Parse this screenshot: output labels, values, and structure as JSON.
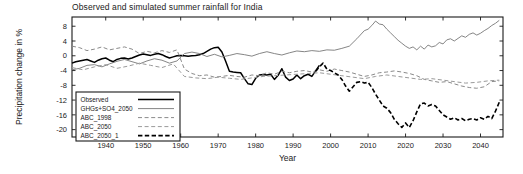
{
  "chart_data": {
    "type": "line",
    "title": "Observed and simulated summer rainfall for India",
    "xlabel": "Year",
    "ylabel": "Precipitation change in %",
    "xlim": [
      1931,
      2046
    ],
    "ylim": [
      -22,
      10.5
    ],
    "xticks": [
      1940,
      1950,
      1960,
      1970,
      1980,
      1990,
      2000,
      2010,
      2020,
      2030,
      2040
    ],
    "yticks": [
      8,
      4,
      0,
      -4,
      -8,
      -12,
      -16,
      -20
    ],
    "grid": false,
    "legend_position": "lower-left-inside",
    "series": [
      {
        "name": "Observed",
        "color": "#000000",
        "style": "solid",
        "width": 1.5,
        "x": [
          1931,
          1932,
          1933,
          1934,
          1935,
          1936,
          1937,
          1938,
          1939,
          1940,
          1941,
          1942,
          1943,
          1944,
          1945,
          1946,
          1947,
          1948,
          1949,
          1950,
          1951,
          1952,
          1953,
          1954,
          1955,
          1956,
          1957,
          1958,
          1959,
          1960,
          1961,
          1962,
          1963,
          1964,
          1965,
          1966,
          1967,
          1968,
          1969,
          1970,
          1971,
          1972,
          1973,
          1974,
          1975,
          1976,
          1977,
          1978,
          1979,
          1980,
          1981,
          1982,
          1983,
          1984,
          1985,
          1986,
          1987,
          1988,
          1989,
          1990,
          1991,
          1992,
          1993,
          1994,
          1995,
          1996,
          1997
        ],
        "y": [
          -2.0,
          -1.6,
          -1.4,
          -1.2,
          -1.0,
          -1.4,
          -1.8,
          -1.2,
          -0.8,
          -0.6,
          -1.2,
          -1.6,
          -1.0,
          -0.7,
          -0.6,
          -0.9,
          -0.6,
          -0.2,
          0.2,
          0.5,
          0.3,
          0.1,
          0.4,
          0.6,
          0.3,
          -0.2,
          -0.6,
          -0.3,
          0.0,
          0.1,
          0.0,
          -0.1,
          0.0,
          0.1,
          0.3,
          0.6,
          1.2,
          1.8,
          2.2,
          2.3,
          1.0,
          -1.5,
          -4.2,
          -4.4,
          -4.5,
          -4.6,
          -6.2,
          -7.6,
          -7.8,
          -6.1,
          -5.2,
          -5.1,
          -5.2,
          -5.0,
          -6.4,
          -5.3,
          -3.5,
          -5.8,
          -6.7,
          -6.3,
          -5.2,
          -6.2,
          -5.4,
          -5.0,
          -5.6,
          -4.1,
          -2.6
        ]
      },
      {
        "name": "GHGs+SO4_2050",
        "color": "#777777",
        "style": "solid",
        "width": 0.9,
        "x": [
          1931,
          1933,
          1935,
          1937,
          1939,
          1941,
          1943,
          1945,
          1947,
          1949,
          1951,
          1953,
          1955,
          1957,
          1959,
          1961,
          1963,
          1965,
          1967,
          1969,
          1971,
          1973,
          1975,
          1977,
          1979,
          1981,
          1983,
          1985,
          1987,
          1989,
          1991,
          1993,
          1995,
          1997,
          1999,
          2001,
          2003,
          2005,
          2007,
          2009,
          2010,
          2011,
          2012,
          2013,
          2014,
          2015,
          2016,
          2017,
          2018,
          2019,
          2020,
          2021,
          2022,
          2023,
          2024,
          2025,
          2026,
          2027,
          2028,
          2029,
          2030,
          2031,
          2032,
          2033,
          2034,
          2035,
          2036,
          2037,
          2038,
          2039,
          2040,
          2041,
          2042,
          2043,
          2044,
          2045
        ],
        "y": [
          -3.8,
          -3.4,
          -2.6,
          -2.4,
          -3.0,
          -2.2,
          -1.5,
          -1.0,
          -1.6,
          -2.2,
          -1.4,
          -0.8,
          -1.2,
          -2.0,
          -1.4,
          0.6,
          1.0,
          0.6,
          -0.2,
          0.4,
          -0.3,
          0.1,
          0.6,
          0.3,
          -0.1,
          0.6,
          1.1,
          0.6,
          0.2,
          0.8,
          1.3,
          1.1,
          1.4,
          1.2,
          1.6,
          1.5,
          2.0,
          2.6,
          4.6,
          6.8,
          7.2,
          8.2,
          9.4,
          8.6,
          8.4,
          7.2,
          6.2,
          5.2,
          4.2,
          3.4,
          2.6,
          2.0,
          2.4,
          1.6,
          2.6,
          1.8,
          2.9,
          2.4,
          2.7,
          3.6,
          3.2,
          4.3,
          4.6,
          4.0,
          4.7,
          5.4,
          5.0,
          5.8,
          6.2,
          5.6,
          6.1,
          6.8,
          7.4,
          8.2,
          8.8,
          9.6
        ]
      },
      {
        "name": "ABC_1998",
        "color": "#8a8a8a",
        "style": "dashed",
        "width": 1.0,
        "x": [
          1931,
          1933,
          1935,
          1937,
          1939,
          1941,
          1943,
          1945,
          1947,
          1949,
          1951,
          1953,
          1955,
          1957,
          1959,
          1961,
          1963,
          1965,
          1967,
          1969,
          1971,
          1973,
          1975,
          1977,
          1979,
          1981,
          1983,
          1985,
          1987,
          1989,
          1991,
          1993,
          1995,
          1997,
          1999,
          2001,
          2003,
          2005,
          2007,
          2009,
          2011,
          2013,
          2015,
          2017,
          2019,
          2021,
          2023,
          2025,
          2027,
          2029,
          2031,
          2033,
          2035,
          2037,
          2039,
          2041,
          2043,
          2045
        ],
        "y": [
          2.6,
          2.2,
          1.4,
          1.8,
          2.4,
          1.6,
          2.0,
          2.4,
          1.8,
          0.6,
          1.2,
          0.8,
          1.4,
          0.9,
          1.6,
          -3.6,
          -4.8,
          -5.4,
          -5.2,
          -5.8,
          -5.6,
          -5.3,
          -5.6,
          -5.8,
          -5.2,
          -5.4,
          -4.6,
          -5.0,
          -4.2,
          -4.6,
          -4.2,
          -4.0,
          -4.4,
          -3.8,
          -4.2,
          -3.6,
          -4.0,
          -4.4,
          -5.0,
          -5.6,
          -5.2,
          -4.6,
          -4.4,
          -4.1,
          -4.4,
          -4.8,
          -5.4,
          -6.4,
          -6.8,
          -7.2,
          -7.0,
          -7.6,
          -8.2,
          -8.6,
          -8.8,
          -8.4,
          -7.0,
          -6.8
        ]
      },
      {
        "name": "ABC_2050",
        "color": "#9a9a9a",
        "style": "dashed",
        "width": 1.0,
        "x": [
          1931,
          1934,
          1937,
          1940,
          1943,
          1946,
          1949,
          1952,
          1955,
          1958,
          1961,
          1964,
          1967,
          1970,
          1973,
          1976,
          1979,
          1982,
          1985,
          1988,
          1991,
          1994,
          1997,
          2000,
          2003,
          2006,
          2009,
          2012,
          2015,
          2018,
          2021,
          2024,
          2027,
          2030,
          2033,
          2036,
          2039,
          2042,
          2045
        ],
        "y": [
          -3.2,
          -3.8,
          -3.0,
          -2.4,
          -3.4,
          -2.8,
          -2.0,
          -2.6,
          -3.2,
          -2.2,
          -5.6,
          -6.0,
          -6.2,
          -5.8,
          -6.1,
          -6.4,
          -6.0,
          -5.6,
          -5.4,
          -5.2,
          -5.0,
          -4.8,
          -4.6,
          -5.0,
          -5.4,
          -5.8,
          -6.2,
          -5.6,
          -5.2,
          -5.6,
          -6.0,
          -6.4,
          -6.2,
          -6.6,
          -7.0,
          -7.4,
          -7.2,
          -6.8,
          -6.6
        ]
      },
      {
        "name": "ABC_2050_1",
        "color": "#000000",
        "style": "dashed-bold",
        "width": 1.6,
        "x": [
          1996,
          1997,
          1998,
          1999,
          2000,
          2001,
          2002,
          2003,
          2004,
          2005,
          2006,
          2007,
          2008,
          2009,
          2010,
          2011,
          2012,
          2013,
          2014,
          2015,
          2016,
          2017,
          2018,
          2019,
          2020,
          2021,
          2022,
          2023,
          2024,
          2025,
          2026,
          2027,
          2028,
          2029,
          2030,
          2031,
          2032,
          2033,
          2034,
          2035,
          2036,
          2037,
          2038,
          2039,
          2040,
          2041,
          2042,
          2043,
          2044,
          2045
        ],
        "y": [
          -4.2,
          -3.0,
          -2.0,
          -3.6,
          -4.0,
          -4.6,
          -5.2,
          -6.4,
          -8.2,
          -9.6,
          -8.4,
          -7.2,
          -7.0,
          -7.4,
          -7.2,
          -8.6,
          -10.4,
          -12.0,
          -13.6,
          -14.2,
          -15.4,
          -17.2,
          -18.4,
          -19.4,
          -18.2,
          -19.4,
          -17.6,
          -15.2,
          -13.0,
          -12.8,
          -13.6,
          -13.2,
          -13.6,
          -14.8,
          -16.0,
          -16.6,
          -17.2,
          -16.8,
          -17.4,
          -17.0,
          -17.6,
          -17.2,
          -17.0,
          -17.4,
          -16.8,
          -17.2,
          -16.4,
          -17.0,
          -15.0,
          -12.6
        ]
      }
    ]
  },
  "legend": {
    "items": [
      {
        "label": "Observed"
      },
      {
        "label": "GHGs+SO4_2050"
      },
      {
        "label": "ABC_1998"
      },
      {
        "label": "ABC_2050"
      },
      {
        "label": "ABC_2050_1"
      }
    ]
  },
  "colors": {
    "observed": "#000000",
    "ghgs": "#777777",
    "abc1998": "#8a8a8a",
    "abc2050": "#9a9a9a",
    "abc2050_1": "#000000",
    "axis": "#1a1a1a",
    "background": "#ffffff"
  }
}
